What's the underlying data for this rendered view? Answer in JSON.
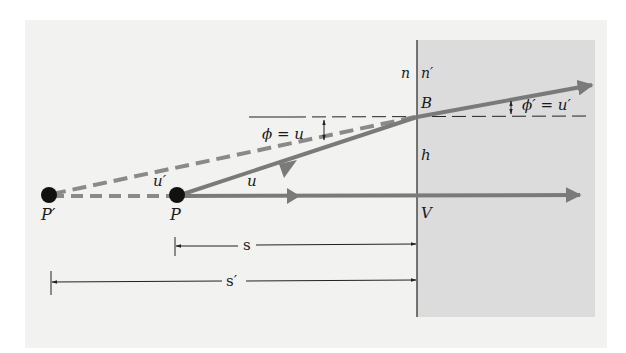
{
  "figure": {
    "colors": {
      "page_bg": "#ffffff",
      "panel_bg": "#f2f2f0",
      "medium_fill": "#dcdcdc",
      "ray": "#7a7a7a",
      "line": "#222222",
      "point": "#111111"
    },
    "media": {
      "left_index": "n",
      "right_index": "n′"
    },
    "points": {
      "object": "P",
      "image": "P′",
      "surface_point": "B",
      "vertex": "V"
    },
    "height_label": "h",
    "angles": {
      "incident": "ϕ = u",
      "refracted": "ϕ′ = u′",
      "ray_angle_object": "u",
      "ray_angle_image": "u′"
    },
    "dimensions": {
      "object_distance": "s",
      "image_distance": "s′"
    }
  }
}
